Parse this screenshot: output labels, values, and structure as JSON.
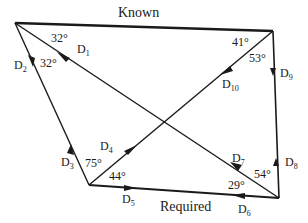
{
  "diagram": {
    "type": "traverse-diagram",
    "labels": {
      "known": "Known",
      "required": "Required"
    },
    "vertices": {
      "A": {
        "x": 15,
        "y": 23
      },
      "B": {
        "x": 273,
        "y": 31
      },
      "C": {
        "x": 89,
        "y": 185
      },
      "D": {
        "x": 279,
        "y": 198
      }
    },
    "lines": [
      {
        "id": "known",
        "from": "A",
        "to": "B",
        "label": "Known"
      },
      {
        "id": "AC",
        "from": "A",
        "to": "C"
      },
      {
        "id": "AD",
        "from": "A",
        "to": "D"
      },
      {
        "id": "BC",
        "from": "B",
        "to": "C"
      },
      {
        "id": "BD",
        "from": "B",
        "to": "D"
      },
      {
        "id": "required",
        "from": "C",
        "to": "D",
        "label": "Required"
      }
    ],
    "directions": [
      {
        "name": "D",
        "sub": "1",
        "x": 88,
        "y": 52
      },
      {
        "name": "D",
        "sub": "2",
        "x": 14,
        "y": 68
      },
      {
        "name": "D",
        "sub": "3",
        "x": 60,
        "y": 165
      },
      {
        "name": "D",
        "sub": "4",
        "x": 100,
        "y": 150
      },
      {
        "name": "D",
        "sub": "5",
        "x": 123,
        "y": 202
      },
      {
        "name": "D",
        "sub": "6",
        "x": 238,
        "y": 213
      },
      {
        "name": "D",
        "sub": "7",
        "x": 233,
        "y": 163
      },
      {
        "name": "D",
        "sub": "8",
        "x": 285,
        "y": 165
      },
      {
        "name": "D",
        "sub": "9",
        "x": 281,
        "y": 77
      },
      {
        "name": "D",
        "sub": "10",
        "x": 222,
        "y": 87
      }
    ],
    "angles": [
      {
        "value": "32°",
        "x": 51,
        "y": 46
      },
      {
        "value": "32°",
        "x": 40,
        "y": 68
      },
      {
        "value": "41°",
        "x": 234,
        "y": 46
      },
      {
        "value": "53°",
        "x": 250,
        "y": 62
      },
      {
        "value": "75°",
        "x": 85,
        "y": 167
      },
      {
        "value": "44°",
        "x": 109,
        "y": 180
      },
      {
        "value": "29°",
        "x": 230,
        "y": 192
      },
      {
        "value": "54°",
        "x": 255,
        "y": 178
      }
    ]
  }
}
